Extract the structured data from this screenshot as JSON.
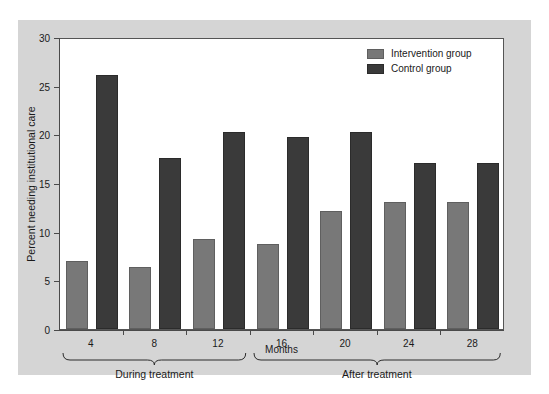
{
  "chart_data": {
    "type": "bar",
    "title": "",
    "xlabel": "Months",
    "ylabel": "Percent needing institutional care",
    "categories": [
      "4",
      "8",
      "12",
      "16",
      "20",
      "24",
      "28"
    ],
    "series": [
      {
        "name": "Intervention group",
        "color": "#787878",
        "values": [
          7.0,
          6.4,
          9.2,
          8.7,
          12.1,
          13.1,
          13.1
        ]
      },
      {
        "name": "Control group",
        "color": "#3a3a3a",
        "values": [
          26.1,
          17.6,
          20.2,
          19.7,
          20.2,
          17.1,
          17.1
        ]
      }
    ],
    "ylim": [
      0,
      30
    ],
    "y_ticks": [
      0,
      5,
      10,
      15,
      20,
      25,
      30
    ],
    "y_tick_labels": [
      "0",
      "5",
      "10",
      "15",
      "20",
      "25",
      "30"
    ],
    "grid": false,
    "legend_position": "top-right",
    "annotations": [
      {
        "label": "During treatment",
        "covers": [
          "4",
          "8",
          "12"
        ]
      },
      {
        "label": "After treatment",
        "covers": [
          "16",
          "20",
          "24",
          "28"
        ]
      }
    ]
  },
  "figure": {
    "background_color": "#d5d5d5",
    "plot_background_color": "#ffffff",
    "axis_color": "#4a4a4a"
  }
}
